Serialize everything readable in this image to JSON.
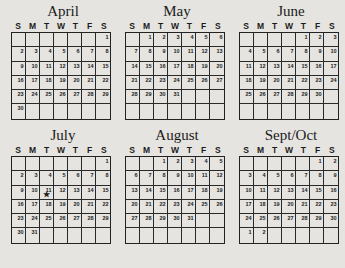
{
  "weekday_headers": [
    "S",
    "M",
    "T",
    "W",
    "T",
    "F",
    "S"
  ],
  "months": [
    {
      "name": "April",
      "start_offset": 6,
      "days": 30,
      "rows": 6,
      "marked_day": null
    },
    {
      "name": "May",
      "start_offset": 1,
      "days": 31,
      "rows": 6,
      "marked_day": null
    },
    {
      "name": "June",
      "start_offset": 4,
      "days": 30,
      "rows": 6,
      "marked_day": null
    },
    {
      "name": "July",
      "start_offset": 6,
      "days": 31,
      "rows": 6,
      "marked_day": 11,
      "marker": "★"
    },
    {
      "name": "August",
      "start_offset": 2,
      "days": 31,
      "rows": 6,
      "marked_day": null
    },
    {
      "name": "Sept/Oct",
      "start_offset": 5,
      "days": 30,
      "overflow_days": [
        1,
        2
      ],
      "rows": 6,
      "marked_day": null
    }
  ]
}
